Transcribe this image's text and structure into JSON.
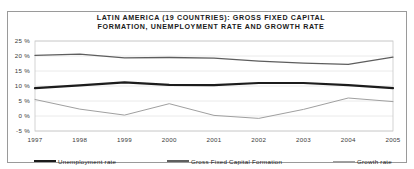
{
  "chart_data": {
    "type": "line",
    "title_line1": "LATIN AMERICA (19 COUNTRIES): GROSS FIXED CAPITAL",
    "title_line2": "FORMATION, UNEMPLOYMENT RATE AND GROWTH RATE",
    "xlabel": "",
    "ylabel": "",
    "categories": [
      "1997",
      "1998",
      "1999",
      "2000",
      "2001",
      "2002",
      "2003",
      "2004",
      "2005"
    ],
    "x_tick_labels": [
      "1997",
      "1998",
      "1999",
      "2000",
      "2001",
      "2002",
      "2003",
      "2004",
      "2005"
    ],
    "y_tick_labels": [
      "25 %",
      "20 %",
      "15 %",
      "10 %",
      "5 %",
      "0 %",
      "-5 %"
    ],
    "y_tick_values": [
      25,
      20,
      15,
      10,
      5,
      0,
      -5
    ],
    "ylim": [
      -5,
      25
    ],
    "grid": true,
    "grid_axis": "y",
    "legend_position": "bottom",
    "series": [
      {
        "name": "Unemployment rate",
        "color": "#1c1c1c",
        "width": 2.2,
        "values": [
          9.3,
          10.2,
          11.2,
          10.4,
          10.3,
          11.0,
          11.0,
          10.3,
          9.3
        ]
      },
      {
        "name": "Gross Fixed Capital Formation",
        "color": "#5e5e5e",
        "width": 1.3,
        "values": [
          20.2,
          20.6,
          19.4,
          19.5,
          19.3,
          18.3,
          17.6,
          17.2,
          19.6
        ]
      },
      {
        "name": "Growth rate",
        "color": "#a0a0a0",
        "width": 1.0,
        "values": [
          5.5,
          2.3,
          0.3,
          4.1,
          0.2,
          -0.8,
          2.2,
          6.0,
          4.8
        ]
      }
    ]
  },
  "legend": {
    "items": [
      {
        "label": "Unemployment rate"
      },
      {
        "label": "Gross Fixed Capital Formation"
      },
      {
        "label": "Growth rate"
      }
    ]
  },
  "colors": {
    "frame_border": "#9a9a9a",
    "gridline": "#e4e4e4",
    "axis_text": "#3a3a3a",
    "title_text": "#1a1a1a",
    "background": "#ffffff"
  }
}
